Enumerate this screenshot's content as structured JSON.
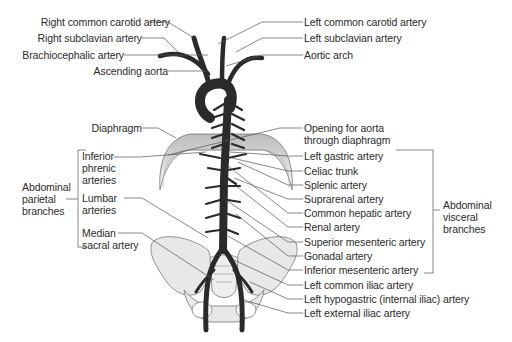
{
  "labels_left": {
    "right_common_carotid": "Right common carotid artery",
    "right_subclavian": "Right subclavian artery",
    "brachiocephalic": "Brachiocephalic artery",
    "ascending_aorta": "Ascending aorta",
    "diaphragm": "Diaphragm",
    "inferior_phrenic": [
      "Inferior",
      "phrenic",
      "arteries"
    ],
    "lumbar": [
      "Lumbar",
      "arteries"
    ],
    "median_sacral": [
      "Median",
      "sacral artery"
    ]
  },
  "group_left": {
    "label": [
      "Abdominal",
      "parietal",
      "branches"
    ]
  },
  "labels_right": {
    "left_common_carotid": "Left common carotid artery",
    "left_subclavian": "Left subclavian artery",
    "aortic_arch": "Aortic arch",
    "opening": [
      "Opening for aorta",
      "through diaphragm"
    ],
    "left_gastric": "Left gastric artery",
    "celiac_trunk": "Celiac trunk",
    "splenic": "Splenic artery",
    "suprarenal": "Suprarenal artery",
    "common_hepatic": "Common hepatic artery",
    "renal": "Renal artery",
    "superior_mesenteric": "Superior mesenteric artery",
    "gonadal": "Gonadal artery",
    "inferior_mesenteric": "Inferior mesenteric artery",
    "left_common_iliac": "Left common iliac artery",
    "left_hypogastric": "Left hypogastric (internal iliac) artery",
    "left_external_iliac": "Left external iliac artery"
  },
  "group_right": {
    "label": [
      "Abdominal",
      "visceral",
      "branches"
    ]
  },
  "colors": {
    "artery": "#3a3a3a",
    "diaphragm": "#cfcfcf",
    "bone": "#e6e6e6",
    "leader": "#555555",
    "text": "#2b2b2b"
  }
}
